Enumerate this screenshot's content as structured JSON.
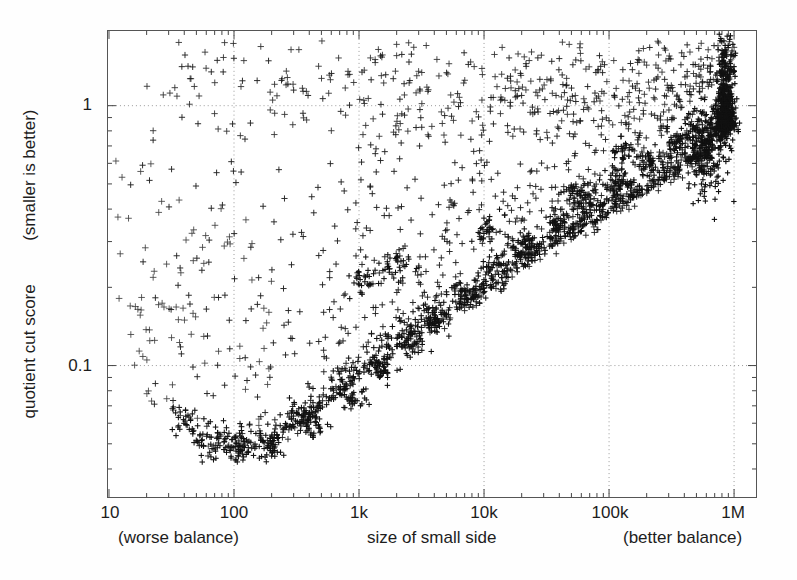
{
  "chart_data": {
    "type": "scatter",
    "title": "",
    "annotation_lines": [
      "Scatter plot showing cuts in a",
      "\"power-law graph\" (Yahoo Groups)"
    ],
    "xlabel": "size of small side",
    "xlabel_left": "(worse balance)",
    "xlabel_right": "(better balance)",
    "ylabel": "quotient cut score",
    "ylabel_secondary": "(smaller is better)",
    "xscale": "log",
    "yscale": "log",
    "xlim": [
      10,
      1000000
    ],
    "ylim": [
      0.04,
      1.85
    ],
    "grid": true,
    "grid_style": "dotted",
    "xticks": [
      10,
      100,
      1000,
      10000,
      100000,
      1000000
    ],
    "xticklabels": [
      "10",
      "100",
      "1k",
      "10k",
      "100k",
      "1M"
    ],
    "yticks": [
      1,
      0.1
    ],
    "yticklabels": [
      "1",
      "0.1"
    ],
    "marker": "plus",
    "marker_color": "#111111",
    "legend": [
      {
        "label": "SDP-LB",
        "marker": "dash",
        "x": 1000000,
        "y": 0.54
      }
    ],
    "series": [
      {
        "name": "quotient cuts",
        "point_count": 1800
      }
    ]
  },
  "axis_text": {
    "x_tick_numbers": [
      "10",
      "100",
      "1k",
      "10k",
      "100k",
      "1M"
    ],
    "y_tick_numbers": [
      "1",
      "0.1"
    ]
  }
}
